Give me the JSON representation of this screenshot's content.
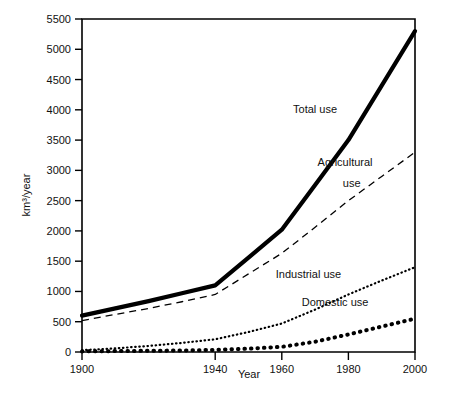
{
  "chart_data": {
    "type": "line",
    "title": "",
    "subtitle": "",
    "xlabel": "Year",
    "ylabel": "km³/year",
    "xlim": [
      1900,
      2000
    ],
    "ylim": [
      0,
      5500
    ],
    "grid": false,
    "legend_position": "inline-annotations",
    "x_ticks": [
      1900,
      1940,
      1960,
      1980,
      2000
    ],
    "x_tick_labels": [
      "1900",
      "1940",
      "1960",
      "1980",
      "2000"
    ],
    "y_ticks": [
      0,
      500,
      1000,
      1500,
      2000,
      2500,
      3000,
      3500,
      4000,
      4500,
      5000,
      5500
    ],
    "y_tick_labels": [
      "0",
      "500",
      "1000",
      "1500",
      "2000",
      "2500",
      "3000",
      "3500",
      "4000",
      "4500",
      "5000",
      "5500"
    ],
    "x": [
      1900,
      1910,
      1920,
      1930,
      1940,
      1950,
      1960,
      1970,
      1980,
      1990,
      2000
    ],
    "series": [
      {
        "name": "Total use",
        "style": "solid-thick",
        "color": "#000000",
        "values": [
          600,
          720,
          840,
          970,
          1100,
          1560,
          2020,
          2760,
          3500,
          4400,
          5300
        ]
      },
      {
        "name": "Agricultural use",
        "style": "dashed",
        "color": "#000000",
        "values": [
          520,
          620,
          720,
          830,
          950,
          1290,
          1630,
          2060,
          2500,
          2900,
          3300
        ]
      },
      {
        "name": "Industrial use",
        "style": "fine-dotted",
        "color": "#000000",
        "values": [
          30,
          60,
          100,
          150,
          210,
          330,
          470,
          700,
          950,
          1180,
          1400
        ]
      },
      {
        "name": "Domestic use",
        "style": "coarse-dotted",
        "color": "#000000",
        "values": [
          10,
          15,
          20,
          25,
          35,
          55,
          85,
          170,
          290,
          420,
          550
        ]
      }
    ],
    "annotations": [
      {
        "text": "Total use",
        "x": 1970,
        "y": 3950
      },
      {
        "text": "Agricultural",
        "x": 1979,
        "y": 3080
      },
      {
        "text": "use",
        "x": 1981,
        "y": 2720
      },
      {
        "text": "Industrial use",
        "x": 1968,
        "y": 1220
      },
      {
        "text": "Domestic use",
        "x": 1976,
        "y": 760
      }
    ]
  },
  "axes": {
    "ylabel": "km³/year",
    "xlabel": "Year"
  },
  "labels": {
    "total_use": "Total use",
    "agricultural_line1": "Agricultural",
    "agricultural_line2": "use",
    "industrial_use": "Industrial use",
    "domestic_use": "Domestic use"
  }
}
